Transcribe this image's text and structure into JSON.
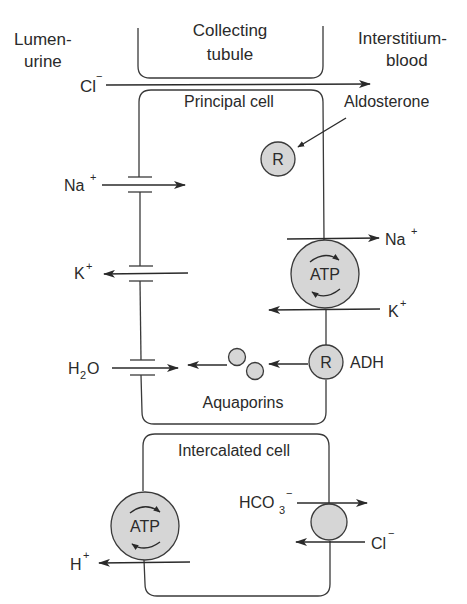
{
  "regions": {
    "lumen": [
      "Lumen-",
      "urine"
    ],
    "tubule": [
      "Collecting",
      "tubule"
    ],
    "interstitium": [
      "Interstitium-",
      "blood"
    ]
  },
  "principal_cell": {
    "title": "Principal cell",
    "hormone_aldosterone": "Aldosterone",
    "receptor_label": "R",
    "hormone_adh": "ADH",
    "pump_label": "ATP",
    "aquaporins_label": "Aquaporins"
  },
  "intercalated_cell": {
    "title": "Intercalated cell",
    "pump_label": "ATP"
  },
  "ions": {
    "cl_top": {
      "base": "Cl",
      "charge": "−"
    },
    "na_apical": {
      "base": "Na",
      "charge": "+"
    },
    "k_apical": {
      "base": "K",
      "charge": "+"
    },
    "h2o": {
      "base": "H",
      "sub": "2",
      "rest": "O"
    },
    "na_basolateral": {
      "base": "Na",
      "charge": "+"
    },
    "k_basolateral": {
      "base": "K",
      "charge": "+"
    },
    "hco3": {
      "base": "HCO",
      "sub": "3",
      "charge": "−"
    },
    "cl_basolateral": {
      "base": "Cl",
      "charge": "−"
    },
    "h_apical": {
      "base": "H",
      "charge": "+"
    }
  },
  "colors": {
    "line": "#2a2a2a",
    "circle_fill": "#d6d6d6",
    "background": "#ffffff"
  }
}
